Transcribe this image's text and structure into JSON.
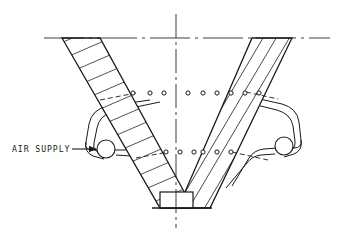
{
  "drawing": {
    "title": "Air-assisted V-hopper cross-section",
    "background_color": "#ffffff",
    "line_color": "#1a1a1a",
    "annotations": [
      {
        "id": "air-supply",
        "label": "AIR SUPPLY",
        "label_x": 12,
        "label_y": 152,
        "leader_start_x": 72,
        "leader_start_y": 149,
        "leader_end_x": 96,
        "leader_end_y": 149,
        "target_x": 106,
        "target_y": 149,
        "target_radius": 9
      }
    ],
    "centerlines": {
      "vertical": {
        "x": 176,
        "y1": 14,
        "y2": 228
      },
      "horizontal": {
        "y": 38,
        "x1": 44,
        "x2": 330
      }
    },
    "hopper": {
      "left_wall_outer_top_x": 62,
      "left_wall_inner_top_x": 100,
      "right_wall_inner_top_x": 252,
      "right_wall_outer_top_x": 292,
      "top_y": 38,
      "bottom_y": 208,
      "outlet_left_x": 160,
      "outlet_right_x": 193,
      "outlet_top_y": 192,
      "outlet_bottom_y": 208,
      "left_hatch_count": 17,
      "right_hatch_count": 6
    },
    "nozzle_rows": [
      {
        "id": "upper-nozzle-row",
        "y": 93,
        "radius": 2.1,
        "left_x": [
          133,
          150,
          164
        ],
        "right_x": [
          188,
          203,
          217,
          231,
          245,
          259
        ]
      },
      {
        "id": "lower-nozzle-row",
        "y": 152,
        "radius": 2.1,
        "left_x": [
          166,
          180,
          194
        ],
        "right_x": [
          203,
          217
        ]
      }
    ],
    "manifolds": [
      {
        "id": "left-air-manifold",
        "side": "left",
        "inlet_circle_x": 106,
        "inlet_circle_y": 149,
        "inlet_circle_r": 9
      },
      {
        "id": "right-air-manifold",
        "side": "right",
        "inlet_circle_x": 284,
        "inlet_circle_y": 146,
        "inlet_circle_r": 9
      }
    ]
  }
}
